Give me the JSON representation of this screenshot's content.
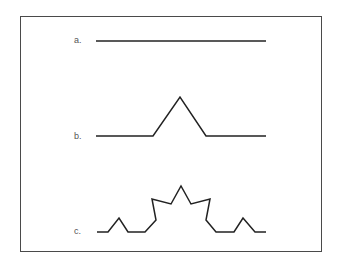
{
  "diagram": {
    "type": "koch-curve-iterations",
    "stroke_color": "#222222",
    "frame_color": "#4a4a4a",
    "label_color": "#555555",
    "items": [
      {
        "label": "a.",
        "label_pos": [
          74,
          35
        ],
        "points": "96,41 266,41"
      },
      {
        "label": "b.",
        "label_pos": [
          74,
          131
        ],
        "points": "96,136 153,136 180,97 206,136 266,136"
      },
      {
        "label": "c.",
        "label_pos": [
          74,
          226
        ],
        "points": "97,232 108,232 119,218 128,232 145,232 156,220 152,199 171,204 181,186 191,204 210,199 206,220 216,232 234,232 243,218 255,232 266,232"
      }
    ]
  }
}
